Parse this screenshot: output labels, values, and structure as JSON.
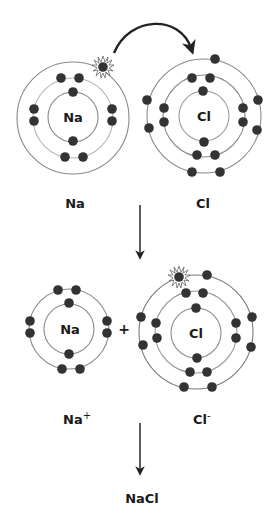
{
  "colors": {
    "electron": "#333333",
    "orbit_dark": "#7a7a7a",
    "orbit_light": "#c8c8c8",
    "arrow": "#222222",
    "text": "#1a1a1a"
  },
  "top_row": {
    "sodium": {
      "nucleus_symbol": "Na",
      "label": "Na",
      "shells": [
        2,
        8,
        1
      ],
      "transferred_electron": "valence electron (starburst)"
    },
    "chlorine": {
      "nucleus_symbol": "Cl",
      "label": "Cl",
      "shells": [
        2,
        8,
        7
      ]
    },
    "transfer_arrow": "curved arrow from Na valence electron to Cl outer shell"
  },
  "bottom_row": {
    "sodium_ion": {
      "nucleus_symbol": "Na",
      "label_base": "Na",
      "label_charge": "+",
      "shells": [
        2,
        8
      ]
    },
    "plus_sign": "+",
    "chloride_ion": {
      "nucleus_symbol": "Cl",
      "label_base": "Cl",
      "label_charge": "-",
      "shells": [
        2,
        8,
        8
      ],
      "gained_electron": "starburst electron"
    }
  },
  "product": {
    "label": "NaCl"
  }
}
